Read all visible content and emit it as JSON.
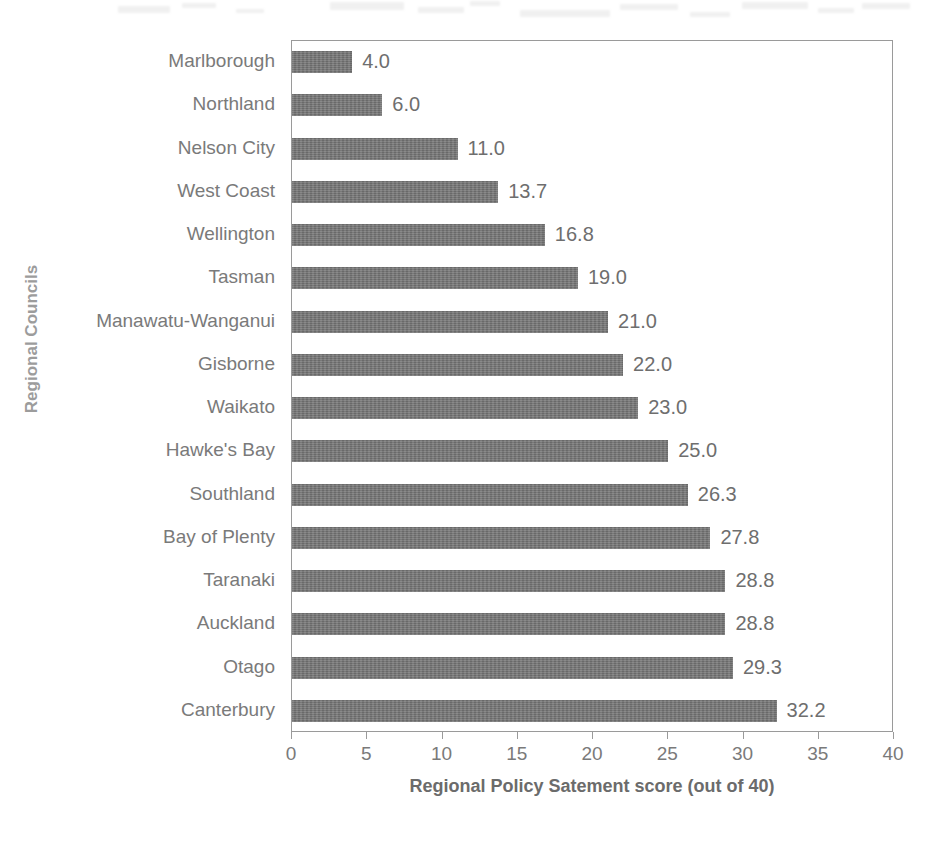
{
  "chart_data": {
    "type": "bar",
    "orientation": "horizontal",
    "title": "",
    "xlabel": "Regional Policy Satement score (out of 40)",
    "ylabel": "Regional Councils",
    "xlim": [
      0,
      40
    ],
    "xticks": [
      0,
      5,
      10,
      15,
      20,
      25,
      30,
      35,
      40
    ],
    "xtick_labels": [
      "0",
      "5",
      "10",
      "15",
      "20",
      "25",
      "30",
      "35",
      "40"
    ],
    "grid": false,
    "legend": false,
    "bar_color": "#737373",
    "categories": [
      "Marlborough",
      "Northland",
      "Nelson City",
      "West Coast",
      "Wellington",
      "Tasman",
      "Manawatu-Wanganui",
      "Gisborne",
      "Waikato",
      "Hawke's Bay",
      "Southland",
      "Bay of Plenty",
      "Taranaki",
      "Auckland",
      "Otago",
      "Canterbury"
    ],
    "values": [
      4.0,
      6.0,
      11.0,
      13.7,
      16.8,
      19.0,
      21.0,
      22.0,
      23.0,
      25.0,
      26.3,
      27.8,
      28.8,
      28.8,
      29.3,
      32.2
    ],
    "value_labels": [
      "4.0",
      "6.0",
      "11.0",
      "13.7",
      "16.8",
      "19.0",
      "21.0",
      "22.0",
      "23.0",
      "25.0",
      "26.3",
      "27.8",
      "28.8",
      "28.8",
      "29.3",
      "32.2"
    ]
  }
}
